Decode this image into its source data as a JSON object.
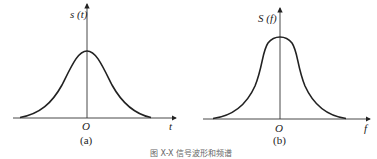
{
  "figure": {
    "caption": "图 X-X  信号波形和频谱",
    "stroke_color": "#222222"
  },
  "panels": [
    {
      "id": "a",
      "sublabel": "(a)",
      "y_axis_label": "s (t)",
      "x_axis_label": "t",
      "origin_label": "O",
      "curve": "gaussian pulse, time domain"
    },
    {
      "id": "b",
      "sublabel": "(b)",
      "y_axis_label": "S (f)",
      "x_axis_label": "f",
      "origin_label": "O",
      "curve": "gaussian spectrum, frequency domain"
    }
  ]
}
